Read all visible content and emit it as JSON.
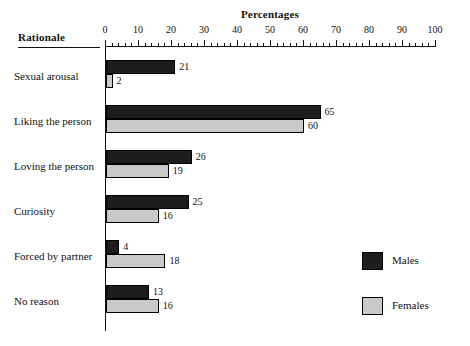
{
  "chart_data": {
    "type": "bar",
    "orientation": "horizontal",
    "title": "Percentages",
    "xlabel": "Percentages",
    "ylabel": "Rationale",
    "xlim": [
      0,
      100
    ],
    "grid": false,
    "legend_position": "bottom-right",
    "axis_header": "Rationale",
    "tick_labels": [
      "0",
      "10",
      "20",
      "30",
      "40",
      "50",
      "60",
      "70",
      "80",
      "90",
      "100"
    ],
    "tick_values": [
      0,
      10,
      20,
      30,
      40,
      50,
      60,
      70,
      80,
      90,
      100
    ],
    "minor_ticks_per_interval": 4,
    "categories": [
      "Sexual arousal",
      "Liking the person",
      "Loving the person",
      "Curiosity",
      "Forced by partner",
      "No reason"
    ],
    "series": [
      {
        "name": "Males",
        "color": "#1d1d1d",
        "values": [
          21,
          65,
          26,
          25,
          4,
          13
        ]
      },
      {
        "name": "Females",
        "color": "#c9c9c9",
        "values": [
          2,
          60,
          19,
          16,
          18,
          16
        ]
      }
    ],
    "legend": [
      {
        "label": "Males",
        "color": "#1d1d1d"
      },
      {
        "label": "Females",
        "color": "#c9c9c9"
      }
    ]
  }
}
